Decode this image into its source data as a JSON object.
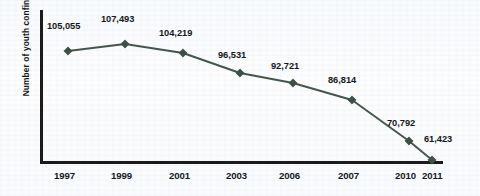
{
  "chart_data": {
    "type": "line",
    "title": "",
    "xlabel": "",
    "ylabel": "Number of youth confined",
    "categories": [
      "1997",
      "1999",
      "2001",
      "2003",
      "2006",
      "2007",
      "2010",
      "2011"
    ],
    "values": [
      105055,
      107493,
      104219,
      96531,
      92721,
      86814,
      70792,
      61423
    ],
    "value_labels": [
      "105,055",
      "107,493",
      "104,219",
      "96,531",
      "92,721",
      "86,814",
      "70,792",
      "61,423"
    ],
    "series": [
      {
        "name": "Number of youth confined",
        "values": [
          105055,
          107493,
          104219,
          96531,
          92721,
          86814,
          70792,
          61423
        ]
      }
    ],
    "ylim": [
      55000,
      112000
    ],
    "grid": false,
    "legend": false,
    "marker": "diamond",
    "line_color": "#44564c",
    "marker_color": "#3d5046",
    "axis_color": "#1b1b1b"
  },
  "axis": {
    "y_title": "Number of youth confined"
  },
  "ticks": {
    "x": [
      "1997",
      "1999",
      "2001",
      "2003",
      "2006",
      "2007",
      "2010",
      "2011"
    ]
  },
  "points": [
    {
      "year": "1997",
      "label": "105,055",
      "px": 68,
      "py": 51,
      "lx": 47,
      "ly": 21
    },
    {
      "year": "1999",
      "label": "107,493",
      "px": 125,
      "py": 44,
      "lx": 101,
      "ly": 14
    },
    {
      "year": "2001",
      "label": "104,219",
      "px": 183,
      "py": 53,
      "lx": 159,
      "ly": 28
    },
    {
      "year": "2003",
      "label": "96,531",
      "px": 240,
      "py": 73,
      "lx": 218,
      "ly": 50
    },
    {
      "year": "2006",
      "label": "92,721",
      "px": 293,
      "py": 83,
      "lx": 271,
      "ly": 61
    },
    {
      "year": "2007",
      "label": "86,814",
      "px": 352,
      "py": 100,
      "lx": 328,
      "ly": 75
    },
    {
      "year": "2010",
      "label": "70,792",
      "px": 409,
      "py": 141,
      "lx": 387,
      "ly": 118
    },
    {
      "year": "2011",
      "label": "61,423",
      "px": 432,
      "py": 160,
      "lx": 424,
      "ly": 134
    }
  ],
  "tick_positions": [
    {
      "label": "1997",
      "x": 68
    },
    {
      "label": "1999",
      "x": 125
    },
    {
      "label": "2001",
      "x": 183
    },
    {
      "label": "2003",
      "x": 240
    },
    {
      "label": "2006",
      "x": 293
    },
    {
      "label": "2007",
      "x": 352
    },
    {
      "label": "2010",
      "x": 409
    },
    {
      "label": "2011",
      "x": 436
    }
  ]
}
